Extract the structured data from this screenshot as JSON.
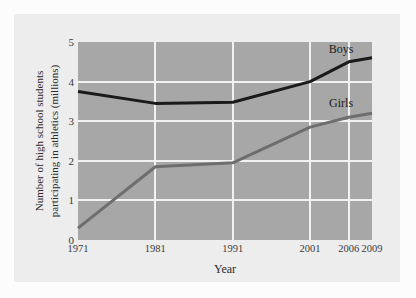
{
  "chart_data": {
    "type": "line",
    "title": "",
    "xlabel": "Year",
    "ylabel": "Number of high school students participating in athletics (millions)",
    "ylabel_line1": "Number of high school students",
    "ylabel_line2": "participating in athletics (millions)",
    "categories": [
      "1971",
      "1981",
      "1991",
      "2001",
      "2006",
      "2009"
    ],
    "x": [
      1971,
      1981,
      1991,
      2001,
      2006,
      2009
    ],
    "xtick_labels": [
      "1971",
      "1981",
      "1991",
      "2001",
      "2006",
      "2009"
    ],
    "ytick_labels": [
      "0",
      "1",
      "2",
      "3",
      "4",
      "5"
    ],
    "ylim": [
      0,
      5
    ],
    "xlim": [
      1971,
      2009
    ],
    "grid": true,
    "grid_color": "#f2f2f2",
    "plot_background": "#a7a7a7",
    "panel_background": "#ededed",
    "legend_position": "inline-labels",
    "series": [
      {
        "name": "Boys",
        "color": "#1a1a1a",
        "values": [
          3.75,
          3.45,
          3.48,
          4.0,
          4.5,
          4.6
        ],
        "label_x": 2005,
        "label_y": 4.82
      },
      {
        "name": "Girls",
        "color": "#6e6e6e",
        "values": [
          0.3,
          1.85,
          1.95,
          2.85,
          3.1,
          3.2
        ],
        "label_x": 2005,
        "label_y": 3.45
      }
    ]
  },
  "axes": {
    "x_title": "Year",
    "y_title_line1": "Number of high school students",
    "y_title_line2": "participating in athletics (millions)"
  },
  "labels": {
    "boys": "Boys",
    "girls": "Girls"
  }
}
